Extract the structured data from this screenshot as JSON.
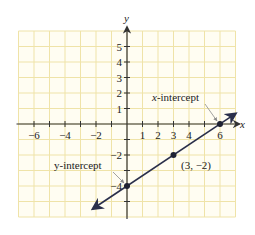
{
  "chart_data": {
    "type": "line",
    "title": "",
    "xlabel": "x",
    "ylabel": "y",
    "xlim": [
      -7,
      7
    ],
    "ylim": [
      -6,
      6
    ],
    "grid": true,
    "x_tick_labels": [
      "-6",
      "-4",
      "-2",
      "1",
      "2",
      "3",
      "4",
      "6"
    ],
    "x_tick_values": [
      -6,
      -4,
      -2,
      1,
      2,
      3,
      4,
      6
    ],
    "y_tick_labels": [
      "5",
      "4",
      "3",
      "2",
      "1",
      "-2",
      "-4"
    ],
    "y_tick_values": [
      5,
      4,
      3,
      2,
      1,
      -2,
      -4
    ],
    "series": [
      {
        "name": "line",
        "equation": "y = (2/3)x - 4",
        "x": [
          -2.2,
          7.0
        ],
        "y": [
          -5.47,
          0.67
        ]
      }
    ],
    "points": [
      {
        "x": 0,
        "y": -4,
        "label": "y-intercept"
      },
      {
        "x": 3,
        "y": -2,
        "label": "(3, −2)"
      },
      {
        "x": 6,
        "y": 0,
        "label": "x-intercept"
      }
    ],
    "annotations": [
      {
        "text": "x-intercept",
        "points_to": [
          6,
          0
        ]
      },
      {
        "text": "y-intercept",
        "points_to": [
          0,
          -4
        ]
      },
      {
        "text": "(3, −2)",
        "near": [
          3,
          -2
        ]
      }
    ]
  },
  "labels": {
    "x_axis": "x",
    "y_axis": "y",
    "x_intercept_prefix": "x",
    "x_intercept_suffix": "-intercept",
    "y_intercept": "y-intercept",
    "point_label": "(3, −2)"
  },
  "colors": {
    "grid": "#efe3a8",
    "grid_bg": "#fffdf2",
    "axis": "#333333",
    "line": "#2a2f4a",
    "point": "#1f2233",
    "leader": "#8a8a8a"
  }
}
